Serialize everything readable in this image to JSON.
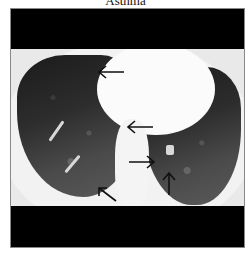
{
  "figure": {
    "title": "Asthma",
    "image_type": "chest-ct-axial",
    "arrows": [
      {
        "id": "arrow-1",
        "direction": "left",
        "x": 97,
        "y": 72
      },
      {
        "id": "arrow-2",
        "direction": "left",
        "x": 126,
        "y": 121
      },
      {
        "id": "arrow-3",
        "direction": "right",
        "x": 128,
        "y": 156
      },
      {
        "id": "arrow-4",
        "direction": "up-left",
        "x": 98,
        "y": 180
      },
      {
        "id": "arrow-5",
        "direction": "up",
        "x": 166,
        "y": 172
      }
    ],
    "colors": {
      "background": "#ffffff",
      "band": "#000000",
      "arrow": "#111111"
    }
  }
}
